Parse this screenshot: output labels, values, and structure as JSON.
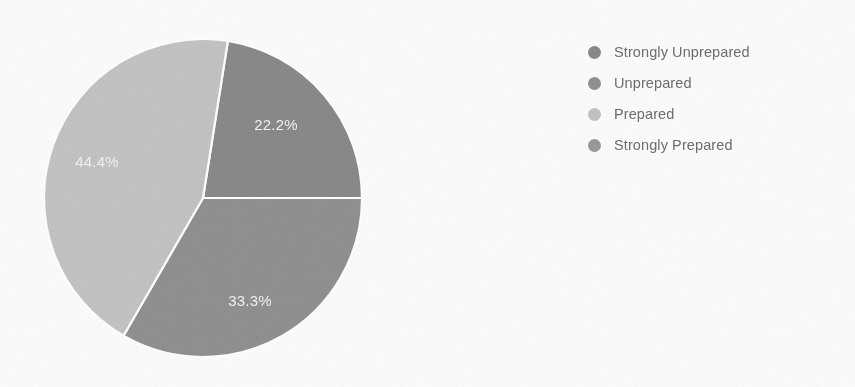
{
  "chart_data": {
    "type": "pie",
    "title": "",
    "categories": [
      "Strongly Unprepared",
      "Unprepared",
      "Prepared",
      "Strongly Prepared"
    ],
    "values": [
      22.2,
      33.3,
      44.4,
      0
    ],
    "value_labels": [
      "22.2%",
      "33.3%",
      "44.4%",
      ""
    ],
    "colors": [
      "#8a8a8a",
      "#919191",
      "#c4c4c4",
      "#9a9a9a"
    ],
    "legend_position": "right",
    "grid": false,
    "units": "percent",
    "start_angle_deg": -81,
    "direction": "clockwise",
    "slices": [
      {
        "label": "Strongly Unprepared",
        "value": 22.2,
        "value_label": "22.2%",
        "color": "#8a8a8a",
        "start_deg": -81,
        "end_deg": 0,
        "label_x": 276,
        "label_y": 126,
        "visible": true
      },
      {
        "label": "Unprepared",
        "value": 33.3,
        "value_label": "33.3%",
        "color": "#919191",
        "start_deg": 0,
        "end_deg": 120,
        "label_x": 250,
        "label_y": 302,
        "visible": true
      },
      {
        "label": "Prepared",
        "value": 44.4,
        "value_label": "44.4%",
        "color": "#c4c4c4",
        "start_deg": 120,
        "end_deg": 279,
        "label_x": 97,
        "label_y": 163,
        "visible": true
      },
      {
        "label": "Strongly Prepared",
        "value": 0,
        "value_label": "",
        "color": "#9a9a9a",
        "start_deg": 279,
        "end_deg": 279,
        "label_x": 0,
        "label_y": 0,
        "visible": false
      }
    ]
  },
  "legend": {
    "items": [
      {
        "label": "Strongly Unprepared",
        "color": "#8a8a8a"
      },
      {
        "label": "Unprepared",
        "color": "#919191"
      },
      {
        "label": "Prepared",
        "color": "#c4c4c4"
      },
      {
        "label": "Strongly Prepared",
        "color": "#9a9a9a"
      }
    ]
  }
}
